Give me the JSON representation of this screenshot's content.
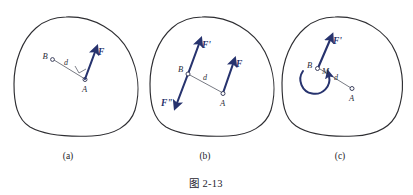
{
  "figure": {
    "caption": "图 2-13",
    "panels": [
      {
        "id": "a",
        "label": "(a)",
        "points": [
          {
            "name": "B",
            "label": "B"
          },
          {
            "name": "A",
            "label": "A"
          }
        ],
        "distance_label": "d",
        "forces": [
          {
            "name": "F",
            "label": "F",
            "direction": "up-right",
            "applied_at": "A"
          }
        ],
        "has_right_angle_mark": true,
        "has_moment_arc": false
      },
      {
        "id": "b",
        "label": "(b)",
        "points": [
          {
            "name": "B",
            "label": "B"
          },
          {
            "name": "A",
            "label": "A"
          }
        ],
        "distance_label": "d",
        "forces": [
          {
            "name": "F-prime",
            "label": "F'",
            "direction": "up-right",
            "applied_at": "B"
          },
          {
            "name": "F-double-prime",
            "label": "F\"",
            "direction": "down-left",
            "applied_at": "B"
          },
          {
            "name": "F",
            "label": "F",
            "direction": "up-right",
            "applied_at": "A"
          }
        ],
        "has_right_angle_mark": false,
        "has_moment_arc": false
      },
      {
        "id": "c",
        "label": "(c)",
        "points": [
          {
            "name": "B",
            "label": "B"
          },
          {
            "name": "M",
            "label": "M"
          },
          {
            "name": "A",
            "label": "A"
          }
        ],
        "distance_label": "d",
        "forces": [
          {
            "name": "F-prime",
            "label": "F'",
            "direction": "up-right",
            "applied_at": "B"
          }
        ],
        "moment_label": "M",
        "has_right_angle_mark": false,
        "has_moment_arc": true
      }
    ]
  },
  "colors": {
    "force_blue": "#27336e",
    "outline_gray": "#2e2e32",
    "thin_gray": "#4a4d5a",
    "text_dark": "#1f2430",
    "background": "#ffffff"
  }
}
